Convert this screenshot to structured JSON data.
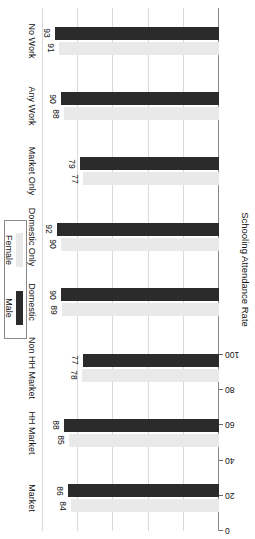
{
  "chart_data": {
    "type": "bar",
    "orientation": "horizontal",
    "title": "",
    "xlabel": "",
    "ylabel": "Schooling Attendance Rate",
    "value_axis_title": "Schooling Attendance Rate",
    "ylim": [
      0,
      100
    ],
    "axis_ticks": [
      "0",
      "20",
      "40",
      "60",
      "80",
      "100"
    ],
    "axis_tick_values": [
      0,
      20,
      40,
      60,
      80,
      100
    ],
    "grid": true,
    "legend_position": "right",
    "categories": [
      "Market",
      "HH Market",
      "Non HH Market",
      "Domestic",
      "Domestic Only",
      "Market Only",
      "Any Work",
      "No Work"
    ],
    "series": [
      {
        "name": "Male",
        "color": "#2b2b2b",
        "values": [
          86,
          88,
          77,
          90,
          92,
          79,
          90,
          93
        ]
      },
      {
        "name": "Female",
        "color": "#e9e9e9",
        "values": [
          84,
          85,
          78,
          89,
          90,
          77,
          88,
          91
        ]
      }
    ],
    "data_labels": {
      "Market": {
        "Male": "86",
        "Female": "84"
      },
      "HH Market": {
        "Male": "88",
        "Female": "85"
      },
      "Non HH Market": {
        "Male": "77",
        "Female": "78"
      },
      "Domestic": {
        "Male": "90",
        "Female": "89"
      },
      "Domestic Only": {
        "Male": "92",
        "Female": "90"
      },
      "Market Only": {
        "Male": "79",
        "Female": "77"
      },
      "Any Work": {
        "Male": "90",
        "Female": "88"
      },
      "No Work": {
        "Male": "93",
        "Female": "91"
      }
    }
  },
  "legend": {
    "entries": [
      {
        "label": "Male",
        "color": "#2b2b2b"
      },
      {
        "label": "Female",
        "color": "#e9e9e9"
      }
    ]
  }
}
